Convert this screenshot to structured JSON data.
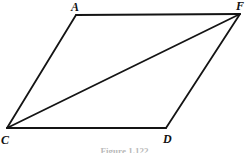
{
  "figure": {
    "shape_name": "parallelogram-with-diagonal",
    "caption": "Figure 1.122",
    "line_color": "#141414",
    "background_color": "#ffffff",
    "stroke_width": 1.8,
    "vertices": [
      {
        "id": "A",
        "label": "A",
        "x": 76,
        "y": 15
      },
      {
        "id": "F",
        "label": "F",
        "x": 240,
        "y": 14
      },
      {
        "id": "C",
        "label": "C",
        "x": 7,
        "y": 128
      },
      {
        "id": "D",
        "label": "D",
        "x": 166,
        "y": 128
      }
    ],
    "edges": [
      {
        "id": "AF",
        "from": "A",
        "to": "F",
        "kind": "side"
      },
      {
        "id": "AC",
        "from": "A",
        "to": "C",
        "kind": "side"
      },
      {
        "id": "CD",
        "from": "C",
        "to": "D",
        "kind": "side"
      },
      {
        "id": "DF",
        "from": "D",
        "to": "F",
        "kind": "side"
      },
      {
        "id": "CF",
        "from": "C",
        "to": "F",
        "kind": "diagonal"
      }
    ]
  }
}
